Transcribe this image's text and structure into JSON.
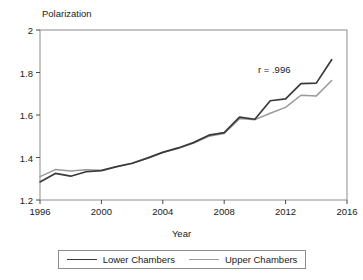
{
  "chart_data": {
    "type": "line",
    "title": "",
    "xlabel": "Year",
    "ylabel": "Polarization",
    "xlim": [
      1996,
      2016
    ],
    "ylim": [
      1.2,
      2.0
    ],
    "grid": false,
    "legend_position": "bottom",
    "annotations": [
      {
        "text": "r = .996",
        "x": 2010.2,
        "y": 1.81
      }
    ],
    "x": [
      1996,
      1997,
      1998,
      1999,
      2000,
      2001,
      2002,
      2003,
      2004,
      2005,
      2006,
      2007,
      2008,
      2009,
      2010,
      2011,
      2012,
      2013,
      2014,
      2015
    ],
    "xticks": [
      1996,
      2000,
      2004,
      2008,
      2012,
      2016
    ],
    "xtick_labels": [
      "1996",
      "2000",
      "2004",
      "2008",
      "2012",
      "2016"
    ],
    "yticks": [
      1.2,
      1.4,
      1.6,
      1.8,
      2.0
    ],
    "ytick_labels": [
      "1.2",
      "1.4",
      "1.6",
      "1.8",
      "2"
    ],
    "series": [
      {
        "name": "Lower Chambers",
        "color": "#3a3a3a",
        "values": [
          1.285,
          1.325,
          1.312,
          1.333,
          1.338,
          1.357,
          1.373,
          1.397,
          1.424,
          1.445,
          1.47,
          1.505,
          1.517,
          1.59,
          1.58,
          1.667,
          1.676,
          1.748,
          1.75,
          1.86
        ]
      },
      {
        "name": "Upper Chambers",
        "color": "#9a9a9a",
        "values": [
          1.31,
          1.343,
          1.336,
          1.342,
          1.34,
          1.357,
          1.372,
          1.398,
          1.425,
          1.442,
          1.468,
          1.5,
          1.513,
          1.583,
          1.578,
          1.608,
          1.636,
          1.693,
          1.69,
          1.762
        ]
      }
    ]
  },
  "legend": {
    "entries": [
      {
        "label": "Lower Chambers"
      },
      {
        "label": "Upper Chambers"
      }
    ]
  }
}
